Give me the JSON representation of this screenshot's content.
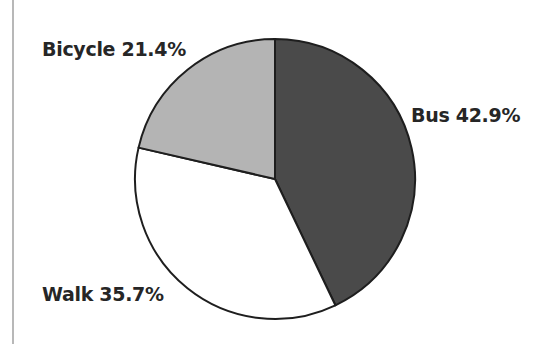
{
  "chart_data": {
    "type": "pie",
    "title": "",
    "categories": [
      "Bus",
      "Walk",
      "Bicycle"
    ],
    "values": [
      42.9,
      35.7,
      21.4
    ],
    "unit": "%",
    "labels": [
      "Bus 42.9%",
      "Walk 35.7%",
      "Bicycle 21.4%"
    ],
    "colors": [
      "#4a4a4a",
      "#ffffff",
      "#b4b4b4"
    ],
    "start_angle": "12 o'clock",
    "direction": "clockwise",
    "legend": "none (inline slice labels)",
    "outline_color": "#1e1e1e"
  },
  "labels": {
    "bus": "Bus 42.9%",
    "walk": "Walk 35.7%",
    "bicycle": "Bicycle 21.4%"
  }
}
